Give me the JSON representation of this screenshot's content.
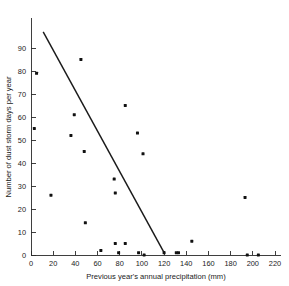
{
  "chart_data": {
    "type": "scatter",
    "title": "",
    "xlabel": "Previous year's annual precipitation (mm)",
    "ylabel": "Number of dust storm days per year",
    "xlim": [
      0,
      220
    ],
    "ylim": [
      0,
      97
    ],
    "grid": false,
    "legend": null,
    "xticks": [
      0,
      20,
      40,
      60,
      80,
      100,
      120,
      140,
      160,
      180,
      200,
      220
    ],
    "xtick_labels": [
      "0",
      "20",
      "40",
      "60",
      "80",
      "100",
      "120",
      "140",
      "160",
      "180",
      "200",
      "220"
    ],
    "yticks": [
      0,
      10,
      20,
      30,
      40,
      50,
      60,
      70,
      80,
      90
    ],
    "ytick_labels": [
      "0",
      "10",
      "20",
      "30",
      "40",
      "50",
      "60",
      "70",
      "80",
      "90"
    ],
    "points": [
      {
        "x": 3,
        "y": 55
      },
      {
        "x": 5,
        "y": 79
      },
      {
        "x": 18,
        "y": 26
      },
      {
        "x": 36,
        "y": 52
      },
      {
        "x": 39,
        "y": 61
      },
      {
        "x": 45,
        "y": 85
      },
      {
        "x": 48,
        "y": 45
      },
      {
        "x": 49,
        "y": 14
      },
      {
        "x": 63,
        "y": 2
      },
      {
        "x": 75,
        "y": 33
      },
      {
        "x": 76,
        "y": 27
      },
      {
        "x": 76,
        "y": 5
      },
      {
        "x": 79,
        "y": 1
      },
      {
        "x": 85,
        "y": 65
      },
      {
        "x": 85,
        "y": 5
      },
      {
        "x": 96,
        "y": 53
      },
      {
        "x": 97,
        "y": 1
      },
      {
        "x": 101,
        "y": 44
      },
      {
        "x": 102,
        "y": 0
      },
      {
        "x": 120,
        "y": 1
      },
      {
        "x": 131,
        "y": 1
      },
      {
        "x": 133,
        "y": 1
      },
      {
        "x": 145,
        "y": 6
      },
      {
        "x": 193,
        "y": 25
      },
      {
        "x": 195,
        "y": 0
      },
      {
        "x": 205,
        "y": 0
      }
    ],
    "trendline": {
      "label": "fitted regression line",
      "x_start": 11,
      "y_start": 97,
      "x_end": 120,
      "y_end": 1
    }
  }
}
